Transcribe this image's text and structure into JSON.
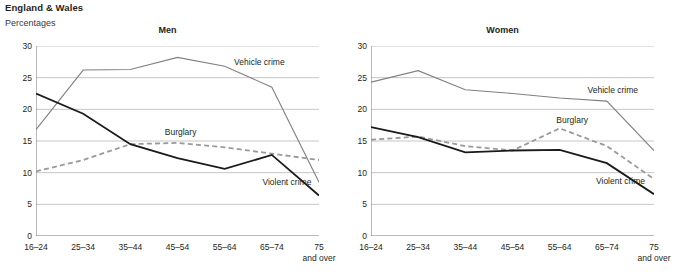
{
  "header": {
    "title": "England & Wales",
    "subtitle": "Percentages"
  },
  "chart_data": [
    {
      "type": "line",
      "title": "Men",
      "xlabel": "",
      "ylabel": "Percentages",
      "categories": [
        "16–24",
        "25–34",
        "35–44",
        "45–54",
        "55–64",
        "65–74",
        "75 and over"
      ],
      "tick_labels": [
        "16–24",
        "25–34",
        "35–44",
        "45–54",
        "55–64",
        "65–74",
        "75"
      ],
      "tick_label_second_line": [
        "",
        "",
        "",
        "",
        "",
        "",
        "and over"
      ],
      "ylim": [
        0,
        30
      ],
      "yticks": [
        0,
        5,
        10,
        15,
        20,
        25,
        30
      ],
      "grid": true,
      "legend": "inline-annotations",
      "series": [
        {
          "name": "Vehicle crime",
          "style": "solid",
          "color": "#808080",
          "width": 1.1,
          "values": [
            16.8,
            26.2,
            26.3,
            28.2,
            26.8,
            23.5,
            8.5
          ]
        },
        {
          "name": "Burglary",
          "style": "dashed",
          "color": "#9a9a9a",
          "width": 1.8,
          "values": [
            10.2,
            12.0,
            14.5,
            14.7,
            14.0,
            13.0,
            12.0
          ]
        },
        {
          "name": "Violent crime",
          "style": "solid",
          "color": "#1a1a1a",
          "width": 1.8,
          "values": [
            22.5,
            19.3,
            14.5,
            12.3,
            10.6,
            12.8,
            6.4
          ]
        }
      ],
      "annotations": [
        {
          "text": "Vehicle crime",
          "x": 0.7,
          "y": 27.3
        },
        {
          "text": "Burglary",
          "x": 0.455,
          "y": 16.2
        },
        {
          "text": "Violent crime",
          "x": 0.8,
          "y": 8.3
        }
      ]
    },
    {
      "type": "line",
      "title": "Women",
      "xlabel": "",
      "ylabel": "Percentages",
      "categories": [
        "16–24",
        "25–34",
        "35–44",
        "45–54",
        "55–64",
        "65–74",
        "75 and over"
      ],
      "tick_labels": [
        "16–24",
        "25–34",
        "35–44",
        "45–54",
        "55–64",
        "65–74",
        "75"
      ],
      "tick_label_second_line": [
        "",
        "",
        "",
        "",
        "",
        "",
        "and over"
      ],
      "ylim": [
        0,
        30
      ],
      "yticks": [
        0,
        5,
        10,
        15,
        20,
        25,
        30
      ],
      "grid": true,
      "legend": "inline-annotations",
      "series": [
        {
          "name": "Vehicle crime",
          "style": "solid",
          "color": "#808080",
          "width": 1.1,
          "values": [
            24.3,
            26.1,
            23.1,
            22.5,
            21.8,
            21.3,
            13.5
          ]
        },
        {
          "name": "Burglary",
          "style": "dashed",
          "color": "#9a9a9a",
          "width": 1.8,
          "values": [
            15.2,
            15.7,
            14.2,
            13.5,
            17.0,
            14.2,
            9.0
          ]
        },
        {
          "name": "Violent crime",
          "style": "solid",
          "color": "#1a1a1a",
          "width": 1.8,
          "values": [
            17.2,
            15.6,
            13.2,
            13.5,
            13.6,
            11.5,
            6.6
          ]
        }
      ],
      "annotations": [
        {
          "text": "Vehicle crime",
          "x": 0.765,
          "y": 22.9
        },
        {
          "text": "Burglary",
          "x": 0.655,
          "y": 18.1
        },
        {
          "text": "Violent crime",
          "x": 0.795,
          "y": 8.6
        }
      ]
    }
  ]
}
